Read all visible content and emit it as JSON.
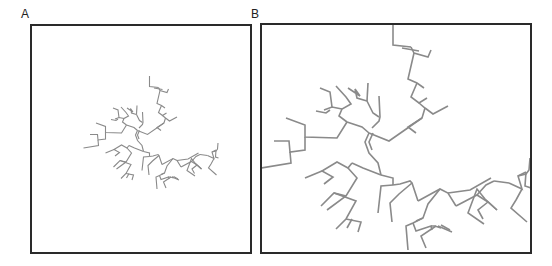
{
  "figure": {
    "panels": [
      {
        "id": "A",
        "label": "A",
        "frame": {
          "x": 30,
          "y": 24,
          "w": 222,
          "h": 230
        },
        "tree_scale": 0.5,
        "tree_offset": [
          59,
          68
        ],
        "stroke_width": 1.1
      },
      {
        "id": "B",
        "label": "B",
        "frame": {
          "x": 260,
          "y": 23,
          "w": 272,
          "h": 231
        },
        "tree_scale": 1.0,
        "tree_offset": [
          0,
          0
        ],
        "stroke_width": 1.6
      }
    ],
    "colors": {
      "branch": "#8a8a8a",
      "frame": "#2a2a2a",
      "label": "#222222"
    }
  },
  "chart_data": {
    "type": "tree",
    "title": "",
    "panel_labels": [
      "A",
      "B"
    ],
    "branches_B_coords": [
      [
        [
          393,
          24
        ],
        [
          393,
          45
        ],
        [
          411,
          47
        ]
      ],
      [
        [
          402,
          48
        ],
        [
          419,
          51
        ]
      ],
      [
        [
          411,
          47
        ],
        [
          414,
          53
        ],
        [
          428,
          57
        ],
        [
          431,
          50
        ]
      ],
      [
        [
          414,
          53
        ],
        [
          408,
          79
        ],
        [
          417,
          83
        ],
        [
          424,
          88
        ]
      ],
      [
        [
          417,
          83
        ],
        [
          411,
          97
        ],
        [
          419,
          103
        ],
        [
          427,
          98
        ]
      ],
      [
        [
          419,
          103
        ],
        [
          425,
          108
        ],
        [
          433,
          114
        ],
        [
          448,
          106
        ]
      ],
      [
        [
          425,
          108
        ],
        [
          422,
          118
        ],
        [
          408,
          127
        ],
        [
          416,
          133
        ]
      ],
      [
        [
          422,
          118
        ],
        [
          389,
          141
        ],
        [
          369,
          133
        ]
      ],
      [
        [
          369,
          133
        ],
        [
          365,
          142
        ],
        [
          369,
          153
        ],
        [
          378,
          163
        ],
        [
          381,
          175
        ]
      ],
      [
        [
          373,
          133
        ],
        [
          369,
          142
        ],
        [
          372,
          150
        ]
      ],
      [
        [
          369,
          133
        ],
        [
          362,
          127
        ],
        [
          347,
          122
        ]
      ],
      [
        [
          372,
          128
        ],
        [
          379,
          121
        ],
        [
          380,
          117
        ],
        [
          379,
          96
        ]
      ],
      [
        [
          379,
          117
        ],
        [
          373,
          113
        ],
        [
          367,
          101
        ]
      ],
      [
        [
          367,
          101
        ],
        [
          368,
          83
        ]
      ],
      [
        [
          367,
          101
        ],
        [
          357,
          98
        ],
        [
          355,
          89
        ],
        [
          360,
          96
        ],
        [
          348,
          88
        ]
      ],
      [
        [
          347,
          122
        ],
        [
          339,
          116
        ],
        [
          342,
          109
        ],
        [
          351,
          104
        ],
        [
          346,
          97
        ],
        [
          336,
          86
        ]
      ],
      [
        [
          342,
          109
        ],
        [
          332,
          107
        ],
        [
          324,
          110
        ]
      ],
      [
        [
          332,
          107
        ],
        [
          330,
          92
        ],
        [
          320,
          88
        ]
      ],
      [
        [
          330,
          110
        ],
        [
          326,
          113
        ],
        [
          316,
          111
        ]
      ],
      [
        [
          347,
          122
        ],
        [
          337,
          138
        ],
        [
          305,
          137
        ],
        [
          305,
          125
        ],
        [
          286,
          118
        ]
      ],
      [
        [
          305,
          137
        ],
        [
          305,
          150
        ],
        [
          290,
          152
        ],
        [
          289,
          141
        ],
        [
          274,
          141
        ]
      ],
      [
        [
          290,
          152
        ],
        [
          291,
          163
        ],
        [
          261,
          168
        ]
      ],
      [
        [
          381,
          175
        ],
        [
          363,
          168
        ],
        [
          352,
          163
        ]
      ],
      [
        [
          352,
          163
        ],
        [
          348,
          168
        ],
        [
          357,
          178
        ],
        [
          346,
          196
        ],
        [
          327,
          210
        ]
      ],
      [
        [
          348,
          168
        ],
        [
          337,
          162
        ],
        [
          322,
          171
        ],
        [
          333,
          177
        ],
        [
          324,
          184
        ]
      ],
      [
        [
          322,
          171
        ],
        [
          305,
          178
        ]
      ],
      [
        [
          346,
          196
        ],
        [
          334,
          193
        ],
        [
          321,
          206
        ]
      ],
      [
        [
          334,
          193
        ],
        [
          356,
          201
        ],
        [
          346,
          219
        ],
        [
          336,
          229
        ]
      ],
      [
        [
          346,
          219
        ],
        [
          361,
          222
        ],
        [
          358,
          232
        ]
      ],
      [
        [
          352,
          219
        ],
        [
          347,
          228
        ]
      ],
      [
        [
          381,
          175
        ],
        [
          393,
          178
        ],
        [
          393,
          185
        ]
      ],
      [
        [
          393,
          185
        ],
        [
          381,
          186
        ],
        [
          378,
          213
        ]
      ],
      [
        [
          393,
          185
        ],
        [
          400,
          184
        ],
        [
          410,
          181
        ],
        [
          412,
          183
        ],
        [
          418,
          201
        ]
      ],
      [
        [
          412,
          183
        ],
        [
          399,
          194
        ],
        [
          390,
          203
        ],
        [
          392,
          222
        ]
      ],
      [
        [
          418,
          201
        ],
        [
          440,
          189
        ],
        [
          448,
          193
        ],
        [
          456,
          206
        ]
      ],
      [
        [
          448,
          193
        ],
        [
          470,
          190
        ],
        [
          491,
          178
        ]
      ],
      [
        [
          440,
          189
        ],
        [
          428,
          204
        ],
        [
          423,
          218
        ],
        [
          416,
          221
        ]
      ],
      [
        [
          423,
          218
        ],
        [
          413,
          223
        ],
        [
          406,
          226
        ],
        [
          408,
          250
        ]
      ],
      [
        [
          413,
          223
        ],
        [
          416,
          231
        ],
        [
          431,
          226
        ],
        [
          432,
          230
        ]
      ],
      [
        [
          431,
          226
        ],
        [
          435,
          226
        ],
        [
          441,
          228
        ],
        [
          438,
          226
        ],
        [
          452,
          232
        ]
      ],
      [
        [
          436,
          226
        ],
        [
          421,
          236
        ],
        [
          426,
          248
        ]
      ],
      [
        [
          441,
          225
        ],
        [
          450,
          230
        ]
      ],
      [
        [
          456,
          206
        ],
        [
          477,
          195
        ],
        [
          488,
          202
        ],
        [
          497,
          210
        ]
      ],
      [
        [
          488,
          202
        ],
        [
          478,
          210
        ],
        [
          483,
          219
        ]
      ],
      [
        [
          497,
          210
        ],
        [
          485,
          199
        ],
        [
          477,
          189
        ],
        [
          468,
          213
        ],
        [
          484,
          224
        ]
      ],
      [
        [
          477,
          195
        ],
        [
          486,
          185
        ],
        [
          494,
          181
        ]
      ],
      [
        [
          494,
          181
        ],
        [
          509,
          183
        ]
      ],
      [
        [
          509,
          183
        ],
        [
          522,
          189
        ],
        [
          518,
          176
        ],
        [
          526,
          172
        ]
      ],
      [
        [
          522,
          189
        ],
        [
          516,
          200
        ],
        [
          511,
          208
        ],
        [
          527,
          222
        ]
      ],
      [
        [
          518,
          176
        ],
        [
          526,
          174
        ],
        [
          529,
          170
        ],
        [
          530,
          158
        ]
      ],
      [
        [
          526,
          172
        ],
        [
          525,
          186
        ],
        [
          531,
          188
        ]
      ]
    ],
    "panel_B_relation": "2x magnification of panel A centered on tree"
  }
}
